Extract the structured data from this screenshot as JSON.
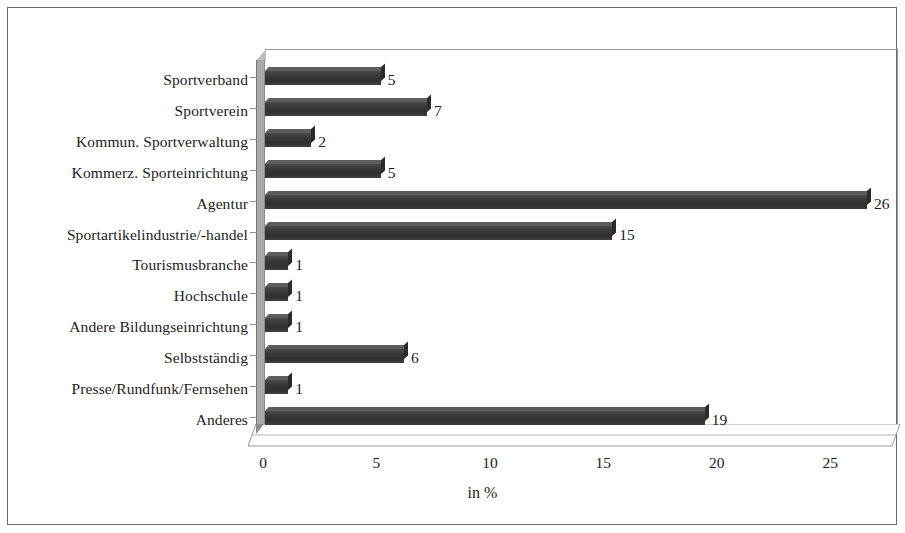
{
  "chart_data": {
    "type": "bar",
    "orientation": "horizontal",
    "title": "",
    "xlabel": "in %",
    "ylabel": "",
    "xlim": [
      0,
      27
    ],
    "xticks": [
      0,
      5,
      10,
      15,
      20,
      25
    ],
    "grid": false,
    "legend": false,
    "bar_color": "#3c3c3c",
    "categories": [
      "Sportverband",
      "Sportverein",
      "Kommun. Sportverwaltung",
      "Kommerz. Sporteinrichtung",
      "Agentur",
      "Sportartikelindustrie/-handel",
      "Tourismusbranche",
      "Hochschule",
      "Andere Bildungseinrichtung",
      "Selbstständig",
      "Presse/Rundfunk/Fernsehen",
      "Anderes"
    ],
    "values": [
      5,
      7,
      2,
      5,
      26,
      15,
      1,
      1,
      1,
      6,
      1,
      19
    ],
    "value_labels": [
      "5",
      "7",
      "2",
      "5",
      "26",
      "15",
      "1",
      "1",
      "1",
      "6",
      "1",
      "19"
    ]
  },
  "axis": {
    "x_tick_labels": [
      "0",
      "5",
      "10",
      "15",
      "20",
      "25"
    ],
    "x_title": "in %"
  }
}
